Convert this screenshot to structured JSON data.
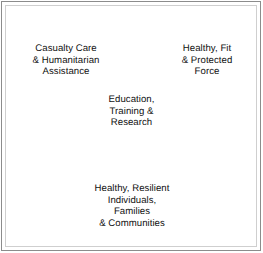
{
  "figure": {
    "type": "venn-diagram",
    "title": "",
    "background_color": "#ffffff",
    "frame_color": "#8c8c8c",
    "inner_frame_color": "#cfcfcf",
    "circle_fill": "#c9c9c9",
    "circle_stroke": "#9a9a9a",
    "text_color": "#111111",
    "star_color": "#ffffff"
  },
  "circles": [
    {
      "id": "casualty-care",
      "label": "Casualty Care\n& Humanitarian\nAssistance",
      "cx": 81,
      "cy": 101,
      "r": 70
    },
    {
      "id": "healthy-fit-force",
      "label": "Healthy, Fit\n& Protected\nForce",
      "cx": 181,
      "cy": 101,
      "r": 70
    },
    {
      "id": "healthy-resilient-communities",
      "label": "Healthy, Resilient\nIndividuals,\nFamilies\n& Communities",
      "cx": 131,
      "cy": 174,
      "r": 70
    }
  ],
  "center": {
    "id": "education-training-research",
    "label": "Education,\nTraining &\nResearch",
    "icon": "five-pointed-star",
    "cx": 131,
    "cy": 115
  }
}
